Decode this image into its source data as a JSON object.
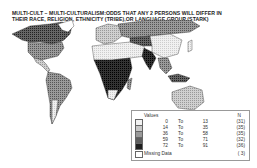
{
  "title": {
    "line1": "MULTI-CULT – MULTI-CULTURALISM:ODDS THAT  ANY 2 PERSONS WILL DIFFER IN",
    "line2": "THEIR  RACE, RELIGION, ETHNICITY (TRIBE),OR LANGUAGE GROUP (STARK)"
  },
  "legend": {
    "header": "Values",
    "n_header": "N",
    "rows": [
      {
        "from": "0",
        "to_label": "To",
        "to": "13",
        "n": "(31)",
        "color": "#f2f2f2"
      },
      {
        "from": "14",
        "to_label": "To",
        "to": "35",
        "n": "(35)",
        "color": "#c8c8c8"
      },
      {
        "from": "36",
        "to_label": "To",
        "to": "58",
        "n": "(35)",
        "color": "#9a9a9a"
      },
      {
        "from": "59",
        "to_label": "To",
        "to": "71",
        "n": "(32)",
        "color": "#5e5e5e"
      },
      {
        "from": "72",
        "to_label": "To",
        "to": "91",
        "n": "(36)",
        "color": "#1e1e1e"
      }
    ],
    "missing": {
      "label": "Missing Data",
      "n": "( 3)",
      "color": "#ffffff"
    }
  },
  "map": {
    "regions": [
      {
        "name": "canada",
        "shade": 4
      },
      {
        "name": "usa",
        "shade": 3
      },
      {
        "name": "mexico-central-america",
        "shade": 2
      },
      {
        "name": "south-america",
        "shade": 3
      },
      {
        "name": "europe",
        "shade": 2
      },
      {
        "name": "russia",
        "shade": 3
      },
      {
        "name": "north-africa-middle-east",
        "shade": 1
      },
      {
        "name": "sub-saharan-africa",
        "shade": 5
      },
      {
        "name": "india",
        "shade": 5
      },
      {
        "name": "china",
        "shade": 1
      },
      {
        "name": "southeast-asia",
        "shade": 4
      },
      {
        "name": "australia",
        "shade": 2
      },
      {
        "name": "greenland",
        "shade": 0
      }
    ]
  }
}
